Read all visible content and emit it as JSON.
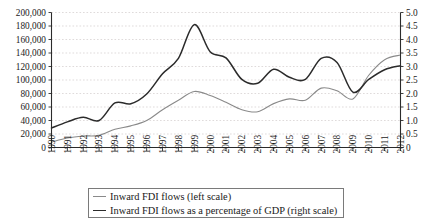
{
  "chart_data": {
    "type": "line",
    "title": "",
    "subtitle": "",
    "xlabel": "",
    "ylabel": "",
    "grid": true,
    "legend_position": "bottom-center",
    "categories": [
      "1990",
      "1991",
      "1992",
      "1993",
      "1994",
      "1995",
      "1996",
      "1997",
      "1998",
      "1999",
      "2000",
      "2001",
      "2002",
      "2003",
      "2004",
      "2005",
      "2006",
      "2007",
      "2008",
      "2009",
      "2010",
      "2011",
      "2012"
    ],
    "x": [
      1990,
      1991,
      1992,
      1993,
      1994,
      1995,
      1996,
      1997,
      1998,
      1999,
      2000,
      2001,
      2002,
      2003,
      2004,
      2005,
      2006,
      2007,
      2008,
      2009,
      2010,
      2011,
      2012
    ],
    "axes": {
      "left": {
        "label": "",
        "ylim": [
          0,
          200000
        ],
        "ticks": [
          0,
          20000,
          40000,
          60000,
          80000,
          100000,
          120000,
          140000,
          160000,
          180000,
          200000
        ],
        "tick_labels": [
          "0",
          "20,000",
          "40,000",
          "60,000",
          "80,000",
          "100,000",
          "120,000",
          "140,000",
          "160,000",
          "180,000",
          "200,000"
        ]
      },
      "right": {
        "label": "",
        "ylim": [
          0,
          5.0
        ],
        "ticks": [
          0,
          0.5,
          1.0,
          1.5,
          2.0,
          2.5,
          3.0,
          3.5,
          4.0,
          4.5,
          5.0
        ],
        "tick_labels": [
          "0",
          "0.5",
          "1.0",
          "1.5",
          "2.0",
          "2.5",
          "3.0",
          "3.5",
          "4.0",
          "4.5",
          "5.0"
        ]
      }
    },
    "series": [
      {
        "name": "Inward FDI flows (left scale)",
        "axis": "left",
        "color": "#8a8a8a",
        "width": 1.1,
        "values": [
          8000,
          14000,
          17000,
          18000,
          27000,
          32000,
          40000,
          56000,
          70000,
          83000,
          77000,
          67000,
          56000,
          53000,
          65000,
          72000,
          70000,
          88000,
          84000,
          72000,
          107000,
          130000,
          137000
        ]
      },
      {
        "name": "Inward FDI flows as a percentage of GDP (right scale)",
        "axis": "right",
        "color": "#2b2b2b",
        "width": 1.5,
        "values": [
          0.72,
          0.95,
          1.12,
          1.0,
          1.65,
          1.62,
          1.98,
          2.73,
          3.3,
          4.55,
          3.55,
          3.32,
          2.52,
          2.38,
          2.9,
          2.6,
          2.52,
          3.3,
          3.15,
          2.05,
          2.52,
          2.88,
          3.03
        ]
      }
    ]
  },
  "legend": {
    "items": [
      {
        "label": "Inward FDI flows (left scale)",
        "color": "#8a8a8a",
        "thickness": "1px"
      },
      {
        "label": "Inward FDI flows as a percentage of GDP (right scale)",
        "color": "#2b2b2b",
        "thickness": "1.6px"
      }
    ]
  }
}
